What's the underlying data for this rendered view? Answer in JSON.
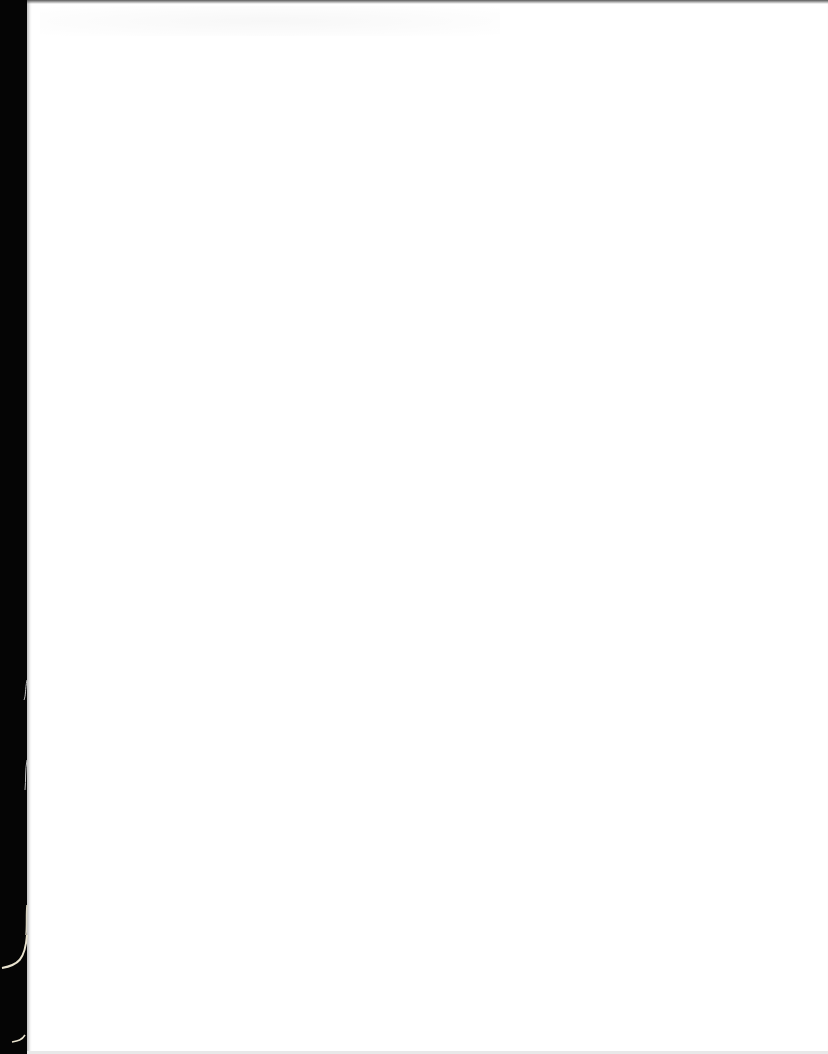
{
  "document": {
    "type": "scanned-page",
    "content_text": "",
    "colors": {
      "paper": "#ffffff",
      "binding": "#050505"
    }
  }
}
